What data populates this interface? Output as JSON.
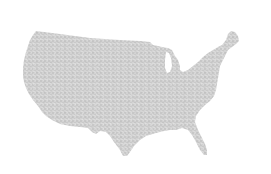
{
  "map": {
    "subject": "Contiguous United States silhouette",
    "style": "stippled dot texture",
    "colors": {
      "background": "#ffffff",
      "fill": "#d2d2d2",
      "dots": "#b4b4b4",
      "dots_light": "#e6e6e6"
    }
  }
}
